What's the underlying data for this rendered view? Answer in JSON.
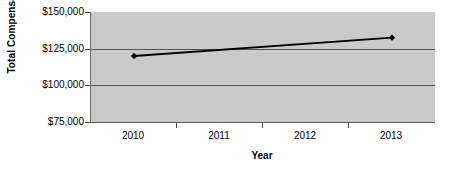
{
  "chart_data": {
    "type": "line",
    "title": "",
    "xlabel": "Year",
    "ylabel": "Total Compensation",
    "categories": [
      "2010",
      "2011",
      "2012",
      "2013"
    ],
    "x": [
      2010,
      2011,
      2012,
      2013
    ],
    "series": [
      {
        "name": "Total Compensation",
        "values": [
          120000,
          null,
          null,
          132500
        ],
        "color": "#000000",
        "marker": "diamond",
        "line_width": 1.8
      }
    ],
    "points": [
      {
        "category": "2010",
        "value": 120000,
        "label": "$120,000"
      },
      {
        "category": "2013",
        "value": 132500,
        "label": "$132,500"
      }
    ],
    "ylim": [
      75000,
      150000
    ],
    "ytick_values": [
      150000,
      125000,
      100000,
      75000
    ],
    "ytick_labels": [
      "$150,000",
      "$125,000",
      "$100,000",
      "$75,000"
    ],
    "grid": true,
    "grid_axis": "y",
    "grid_color": "#555555",
    "legend": false,
    "legend_position": "none",
    "plot_background": "#c9c9c9",
    "figure_background": "#ffffff"
  },
  "axes": {
    "y_title": "Total Compensation",
    "x_title": "Year"
  }
}
